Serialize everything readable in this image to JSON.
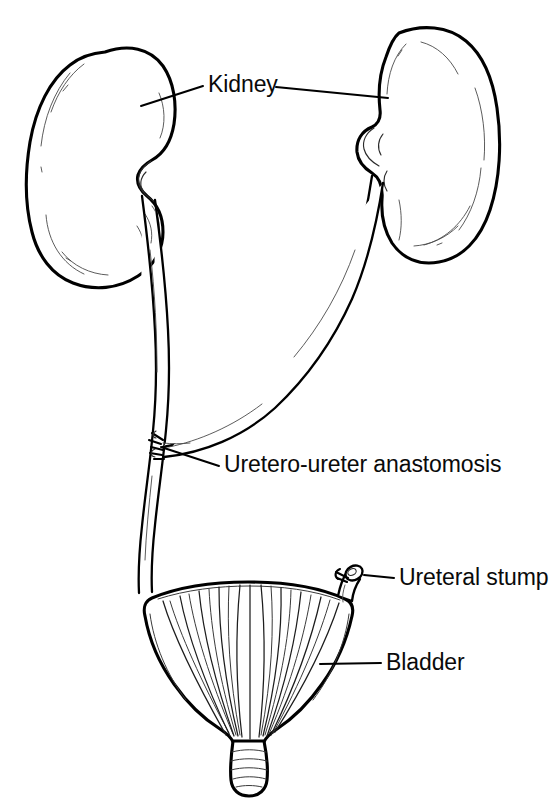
{
  "figure": {
    "background_color": "#ffffff",
    "ink_color": "#000000",
    "width": 558,
    "height": 805
  },
  "labels": [
    {
      "id": "kidney",
      "text": "Kidney",
      "x": 208,
      "y": 92,
      "anchor": "start",
      "leaders": [
        "left",
        "right"
      ]
    },
    {
      "id": "uretero-ureter-anastomosis",
      "text": "Uretero-ureter anastomosis",
      "x": 224,
      "y": 472,
      "anchor": "start",
      "leaders": [
        "left"
      ]
    },
    {
      "id": "ureteral-stump",
      "text": "Ureteral stump",
      "x": 399,
      "y": 585,
      "anchor": "start",
      "leaders": [
        "left"
      ]
    },
    {
      "id": "bladder",
      "text": "Bladder",
      "x": 386,
      "y": 670,
      "anchor": "start",
      "leaders": [
        "left"
      ]
    }
  ],
  "structures": [
    {
      "id": "left-kidney",
      "name": "Left kidney",
      "side": "left"
    },
    {
      "id": "right-kidney",
      "name": "Right kidney",
      "side": "right"
    },
    {
      "id": "left-ureter",
      "name": "Left ureter",
      "side": "left"
    },
    {
      "id": "right-ureter",
      "name": "Right ureter (crossing)",
      "side": "right"
    },
    {
      "id": "anastomosis-site",
      "name": "Uretero-ureter anastomosis site",
      "side": "center"
    },
    {
      "id": "ureteral-stump",
      "name": "Ligated ureteral stump",
      "side": "right"
    },
    {
      "id": "bladder",
      "name": "Bladder",
      "side": "center"
    },
    {
      "id": "bladder-neck",
      "name": "Bladder neck / urethra",
      "side": "center"
    }
  ]
}
